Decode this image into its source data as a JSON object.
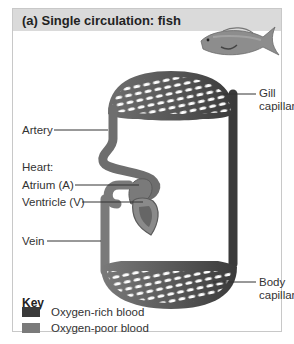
{
  "figure": {
    "title": "(a) Single circulation: fish",
    "illustration": "fish-icon"
  },
  "labels": {
    "gill_capillaries_1": "Gill",
    "gill_capillaries_2": "capillaries",
    "artery": "Artery",
    "heart": "Heart:",
    "atrium": "Atrium (A)",
    "ventricle": "Ventricle (V)",
    "vein": "Vein",
    "body_capillaries_1": "Body",
    "body_capillaries_2": "capillaries"
  },
  "key": {
    "title": "Key",
    "items": [
      {
        "label": "Oxygen-rich blood",
        "color": "#3a3a3a"
      },
      {
        "label": "Oxygen-poor blood",
        "color": "#7a7a7a"
      }
    ]
  },
  "colors": {
    "header_bg": "#dadada",
    "oxygen_rich": "#3a3a3a",
    "oxygen_poor": "#7a7a7a"
  }
}
